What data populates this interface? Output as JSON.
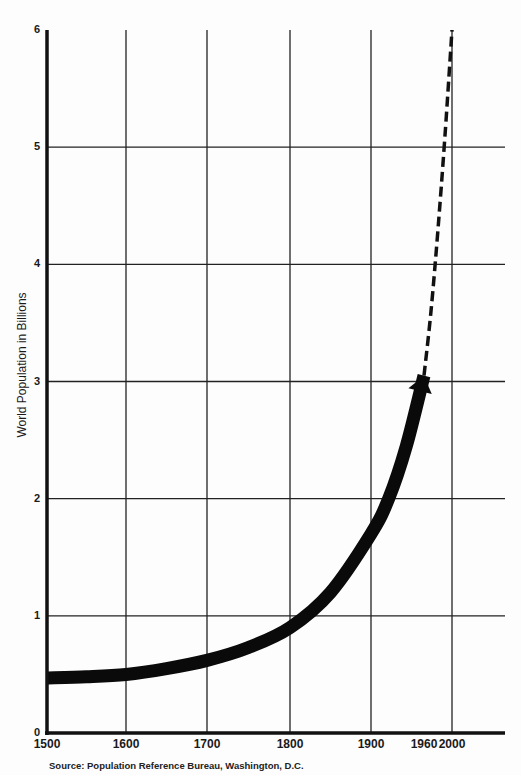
{
  "chart_data": {
    "type": "line",
    "title": "",
    "xlabel": "",
    "ylabel": "World Population in Billions",
    "source": "Source: Population Reference Bureau, Washington, D.C.",
    "x_tick_labels": [
      "1500",
      "1600",
      "1700",
      "1800",
      "1900",
      "1960",
      "2000"
    ],
    "y_tick_labels": [
      "0",
      "1",
      "2",
      "3",
      "4",
      "5",
      "6"
    ],
    "ylim": [
      0,
      6
    ],
    "xlim": [
      1500,
      2000
    ],
    "grid": true,
    "series": [
      {
        "name": "Historical population (solid)",
        "style": "solid-thick-arrow",
        "x": [
          1500,
          1550,
          1600,
          1650,
          1700,
          1750,
          1800,
          1850,
          1900,
          1920,
          1940,
          1960
        ],
        "values": [
          0.47,
          0.48,
          0.5,
          0.55,
          0.62,
          0.73,
          0.9,
          1.2,
          1.7,
          2.0,
          2.45,
          3.05
        ]
      },
      {
        "name": "Projected population (dashed)",
        "style": "dashed",
        "x": [
          1960,
          1970,
          1980,
          1990,
          2000
        ],
        "values": [
          3.05,
          3.6,
          4.3,
          5.1,
          6.0
        ]
      }
    ]
  },
  "axis": {
    "y_label": "World Population in Billions",
    "source": "Source: Population Reference Bureau, Washington, D.C."
  }
}
